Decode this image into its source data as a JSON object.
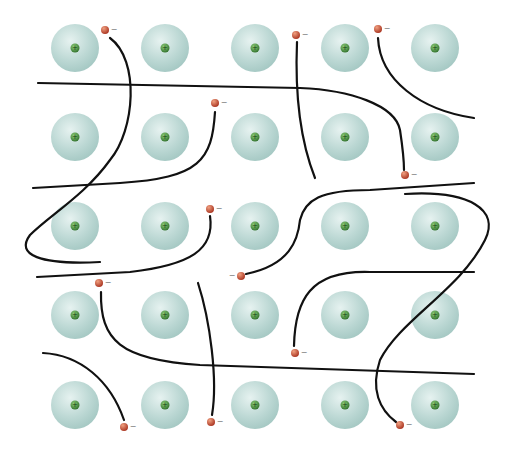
{
  "diagram": {
    "title": "",
    "colors": {
      "background": "#ffffff",
      "ion_light": "#e3f0ee",
      "ion_mid": "#b9d6d2",
      "ion_dark": "#9cc2bd",
      "nucleus": "#2e7a2e",
      "nucleus_highlight": "#8fcf7a",
      "electron": "#c0392b",
      "electron_highlight": "#f0a080",
      "path": "#111111"
    },
    "ion_radius": 24,
    "electron_radius": 4,
    "ion_symbol": "+",
    "electron_symbol": "−",
    "ions": [
      {
        "x": 75,
        "y": 48
      },
      {
        "x": 165,
        "y": 48
      },
      {
        "x": 255,
        "y": 48
      },
      {
        "x": 345,
        "y": 48
      },
      {
        "x": 435,
        "y": 48
      },
      {
        "x": 75,
        "y": 137
      },
      {
        "x": 165,
        "y": 137
      },
      {
        "x": 255,
        "y": 137
      },
      {
        "x": 345,
        "y": 137
      },
      {
        "x": 435,
        "y": 137
      },
      {
        "x": 75,
        "y": 226
      },
      {
        "x": 165,
        "y": 226
      },
      {
        "x": 255,
        "y": 226
      },
      {
        "x": 345,
        "y": 226
      },
      {
        "x": 435,
        "y": 226
      },
      {
        "x": 75,
        "y": 315
      },
      {
        "x": 165,
        "y": 315
      },
      {
        "x": 255,
        "y": 315
      },
      {
        "x": 345,
        "y": 315
      },
      {
        "x": 435,
        "y": 315
      },
      {
        "x": 75,
        "y": 405
      },
      {
        "x": 165,
        "y": 405
      },
      {
        "x": 255,
        "y": 405
      },
      {
        "x": 345,
        "y": 405
      },
      {
        "x": 435,
        "y": 405
      }
    ],
    "electrons": [
      {
        "x": 105,
        "y": 30,
        "label_side": "right"
      },
      {
        "x": 215,
        "y": 103,
        "label_side": "right"
      },
      {
        "x": 296,
        "y": 35,
        "label_side": "right"
      },
      {
        "x": 378,
        "y": 29,
        "label_side": "right"
      },
      {
        "x": 405,
        "y": 175,
        "label_side": "right"
      },
      {
        "x": 210,
        "y": 209,
        "label_side": "right"
      },
      {
        "x": 241,
        "y": 276,
        "label_side": "left"
      },
      {
        "x": 99,
        "y": 283,
        "label_side": "right"
      },
      {
        "x": 295,
        "y": 353,
        "label_side": "right"
      },
      {
        "x": 124,
        "y": 427,
        "label_side": "right"
      },
      {
        "x": 211,
        "y": 422,
        "label_side": "right"
      },
      {
        "x": 400,
        "y": 425,
        "label_side": "right"
      }
    ],
    "paths": [
      "M110,38 C140,60 135,130 110,160 C85,195 50,215 30,235 C15,255 40,265 100,262",
      "M38,83 L300,88 C350,90 395,105 400,130 C403,150 404,160 404,170",
      "M215,112 C212,160 200,178 120,183 L33,188",
      "M297,42 C295,90 300,140 315,178",
      "M378,38 C380,80 420,110 474,118",
      "M210,216 C215,250 190,265 130,272 L37,277",
      "M246,274 C290,265 298,240 300,220 C305,200 320,190 370,190 L474,183",
      "M405,194 C470,190 500,210 485,240 C460,290 400,320 380,360 C370,390 380,410 396,422",
      "M101,292 C100,340 120,360 200,365 L474,374",
      "M294,346 C295,300 310,270 370,272 L474,272",
      "M43,353 C80,355 110,380 124,420",
      "M198,283 C210,320 218,380 212,415"
    ]
  }
}
